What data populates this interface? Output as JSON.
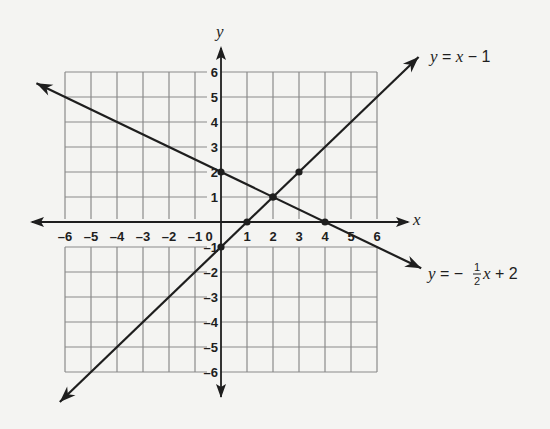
{
  "chart_data": {
    "type": "line",
    "title": "",
    "xlabel": "x",
    "ylabel": "y",
    "xlim": [
      -6,
      6
    ],
    "ylim": [
      -6,
      6
    ],
    "grid": true,
    "x_ticks": [
      "-6",
      "-5",
      "-4",
      "-3",
      "-2",
      "-1",
      "0",
      "1",
      "2",
      "3",
      "4",
      "5",
      "6"
    ],
    "y_ticks": [
      "6",
      "5",
      "4",
      "3",
      "2",
      "1",
      "-1",
      "-2",
      "-3",
      "-4",
      "-5",
      "-6"
    ],
    "series": [
      {
        "name": "y = x - 1",
        "label_parts": {
          "lhs": "y",
          "eq": " = ",
          "var": "x",
          "rest": " − 1"
        },
        "slope": 1,
        "intercept": -1,
        "marked_points": [
          [
            0,
            -1
          ],
          [
            1,
            0
          ],
          [
            2,
            1
          ],
          [
            3,
            2
          ]
        ]
      },
      {
        "name": "y = -1/2 x + 2",
        "label_parts": {
          "lhs": "y",
          "eq": " = −",
          "frac_num": "1",
          "frac_den": "2",
          "var": "x",
          "rest": " + 2"
        },
        "slope": -0.5,
        "intercept": 2,
        "marked_points": [
          [
            0,
            2
          ],
          [
            2,
            1
          ],
          [
            4,
            0
          ]
        ]
      }
    ],
    "intersection": [
      2,
      1
    ]
  }
}
